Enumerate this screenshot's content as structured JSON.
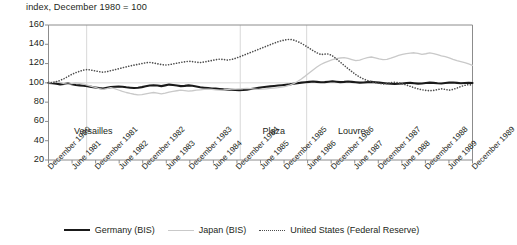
{
  "chart_data": {
    "type": "line",
    "title": "index, December 1980 = 100",
    "xlabel": "",
    "ylabel": "",
    "ylim": [
      20,
      160
    ],
    "yticks": [
      20,
      40,
      60,
      80,
      100,
      120,
      140,
      160
    ],
    "grid": "vertical-event-lines",
    "legend_position": "bottom-center",
    "xtick_labels": [
      "December 1980",
      "June 1981",
      "December 1981",
      "June 1982",
      "December 1982",
      "June 1983",
      "December 1983",
      "June 1984",
      "December 1984",
      "June 1985",
      "December 1985",
      "June 1986",
      "December 1986",
      "June 1987",
      "December 1987",
      "June 1988",
      "December 1988",
      "June 1989",
      "December 1989"
    ],
    "annotations": [
      {
        "label": "Versailles",
        "x_index": 1.0
      },
      {
        "label": "Plaza",
        "x_index": 9.0
      },
      {
        "label": "Louvre",
        "x_index": 12.2
      }
    ],
    "event_lines": [
      1.62,
      8.14,
      10.96
    ],
    "series": [
      {
        "name": "Germany (BIS)",
        "color": "#1a1a1a",
        "style": "solid",
        "width": 2.1,
        "values": [
          100.0,
          99.6,
          99.0,
          98.4,
          98.8,
          99.3,
          98.6,
          97.8,
          97.4,
          97.0,
          96.4,
          95.8,
          95.2,
          94.6,
          94.2,
          94.9,
          95.6,
          96.0,
          96.3,
          96.0,
          95.4,
          95.0,
          94.6,
          95.0,
          95.6,
          96.4,
          97.2,
          97.6,
          97.2,
          96.6,
          97.4,
          98.2,
          97.8,
          97.2,
          96.6,
          96.9,
          97.4,
          97.0,
          96.2,
          95.4,
          95.0,
          94.6,
          94.2,
          94.0,
          93.6,
          93.2,
          93.0,
          92.8,
          92.6,
          92.4,
          92.6,
          93.0,
          93.6,
          94.2,
          94.8,
          95.4,
          96.0,
          96.4,
          96.8,
          97.2,
          97.6,
          98.0,
          98.4,
          99.0,
          99.6,
          100.2,
          100.6,
          101.0,
          101.4,
          101.0,
          100.6,
          100.8,
          101.2,
          101.6,
          101.2,
          100.8,
          101.0,
          101.4,
          101.0,
          100.6,
          100.2,
          100.4,
          100.8,
          101.0,
          100.6,
          100.2,
          99.8,
          99.4,
          99.0,
          98.8,
          99.0,
          99.4,
          99.8,
          100.0,
          99.6,
          99.2,
          99.4,
          99.8,
          100.2,
          100.0,
          99.6,
          99.4,
          99.8,
          100.2,
          100.4,
          100.0,
          99.6,
          99.8,
          100.0,
          99.8
        ]
      },
      {
        "name": "Japan (BIS)",
        "color": "#c9c9c9",
        "style": "solid",
        "width": 1.3,
        "values": [
          100.0,
          100.6,
          101.2,
          100.4,
          99.2,
          98.4,
          99.2,
          100.0,
          99.4,
          98.6,
          97.6,
          96.4,
          95.2,
          94.0,
          93.2,
          94.0,
          95.0,
          94.0,
          92.6,
          91.2,
          90.0,
          89.0,
          88.2,
          87.6,
          87.8,
          88.6,
          89.4,
          90.0,
          89.4,
          88.6,
          89.4,
          90.4,
          91.2,
          91.8,
          92.4,
          92.0,
          91.4,
          91.8,
          92.4,
          92.8,
          93.2,
          93.6,
          93.2,
          92.8,
          92.4,
          92.6,
          93.0,
          93.4,
          93.6,
          93.8,
          94.0,
          94.2,
          94.0,
          93.6,
          93.2,
          93.4,
          93.8,
          94.2,
          94.6,
          95.0,
          95.6,
          96.4,
          97.6,
          99.2,
          101.4,
          104.0,
          107.0,
          110.2,
          113.4,
          116.4,
          119.0,
          121.0,
          122.6,
          124.0,
          125.0,
          125.8,
          126.2,
          125.4,
          124.2,
          123.0,
          123.6,
          125.0,
          126.2,
          126.8,
          126.0,
          124.8,
          124.0,
          124.4,
          125.6,
          127.0,
          128.4,
          129.6,
          130.4,
          130.8,
          131.2,
          130.6,
          129.6,
          130.2,
          131.0,
          130.4,
          129.2,
          128.0,
          127.2,
          126.0,
          124.4,
          123.0,
          122.0,
          121.0,
          119.6,
          118.2
        ]
      },
      {
        "name": "United States (Federal Reserve)",
        "color": "#4d4d4d",
        "style": "dotted",
        "width": 1.6,
        "values": [
          100.0,
          100.4,
          101.2,
          102.6,
          104.4,
          106.6,
          108.8,
          110.6,
          112.0,
          113.2,
          113.8,
          113.2,
          112.4,
          111.6,
          111.0,
          111.6,
          112.6,
          113.6,
          114.6,
          115.6,
          116.6,
          117.6,
          118.4,
          119.2,
          120.0,
          120.8,
          121.2,
          120.6,
          119.8,
          119.0,
          118.4,
          118.8,
          119.6,
          120.4,
          121.2,
          121.8,
          122.4,
          122.0,
          121.4,
          121.0,
          121.6,
          122.4,
          123.2,
          124.0,
          124.6,
          124.2,
          123.6,
          124.2,
          125.4,
          126.8,
          128.4,
          130.0,
          131.6,
          133.2,
          134.8,
          136.4,
          138.0,
          139.6,
          141.2,
          142.6,
          143.8,
          144.6,
          145.2,
          144.4,
          143.0,
          141.0,
          138.6,
          136.0,
          133.4,
          131.2,
          129.4,
          129.8,
          130.0,
          128.0,
          125.0,
          121.6,
          118.2,
          114.8,
          111.6,
          108.6,
          106.0,
          104.0,
          102.4,
          101.2,
          100.2,
          99.4,
          98.8,
          99.4,
          100.2,
          100.6,
          100.0,
          99.0,
          97.8,
          96.4,
          95.0,
          93.8,
          92.8,
          92.2,
          91.8,
          92.2,
          93.0,
          93.8,
          93.2,
          92.4,
          93.2,
          94.6,
          96.2,
          97.4,
          98.2,
          97.6
        ]
      }
    ]
  },
  "legend": {
    "items": [
      {
        "label": "Germany (BIS)"
      },
      {
        "label": "Japan (BIS)"
      },
      {
        "label": "United States (Federal Reserve)"
      }
    ]
  }
}
